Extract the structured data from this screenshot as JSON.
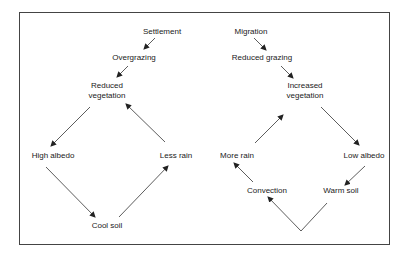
{
  "diagram": {
    "type": "flow",
    "left_cycle": {
      "nodes": [
        {
          "id": "settlement",
          "label": "Settlement"
        },
        {
          "id": "overgrazing",
          "label": "Overgrazing"
        },
        {
          "id": "reduced_vegetation",
          "label": "Reduced vegetation",
          "line1": "Reduced",
          "line2": "vegetation"
        },
        {
          "id": "high_albedo",
          "label": "High albedo"
        },
        {
          "id": "cool_soil",
          "label": "Cool soil"
        },
        {
          "id": "less_rain",
          "label": "Less rain"
        }
      ],
      "edges": [
        [
          "settlement",
          "overgrazing"
        ],
        [
          "overgrazing",
          "reduced_vegetation"
        ],
        [
          "reduced_vegetation",
          "high_albedo"
        ],
        [
          "high_albedo",
          "cool_soil"
        ],
        [
          "cool_soil",
          "less_rain"
        ],
        [
          "less_rain",
          "reduced_vegetation"
        ]
      ]
    },
    "right_cycle": {
      "nodes": [
        {
          "id": "migration",
          "label": "Migration"
        },
        {
          "id": "reduced_grazing",
          "label": "Reduced grazing"
        },
        {
          "id": "increased_vegetation",
          "label": "Increased vegetation",
          "line1": "Increased",
          "line2": "vegetation"
        },
        {
          "id": "low_albedo",
          "label": "Low albedo"
        },
        {
          "id": "warm_soil",
          "label": "Warm soil"
        },
        {
          "id": "convection",
          "label": "Convection"
        },
        {
          "id": "more_rain",
          "label": "More rain"
        }
      ],
      "edges": [
        [
          "migration",
          "reduced_grazing"
        ],
        [
          "reduced_grazing",
          "increased_vegetation"
        ],
        [
          "increased_vegetation",
          "low_albedo"
        ],
        [
          "low_albedo",
          "warm_soil"
        ],
        [
          "warm_soil",
          "convection"
        ],
        [
          "convection",
          "more_rain"
        ],
        [
          "more_rain",
          "increased_vegetation"
        ]
      ]
    }
  }
}
